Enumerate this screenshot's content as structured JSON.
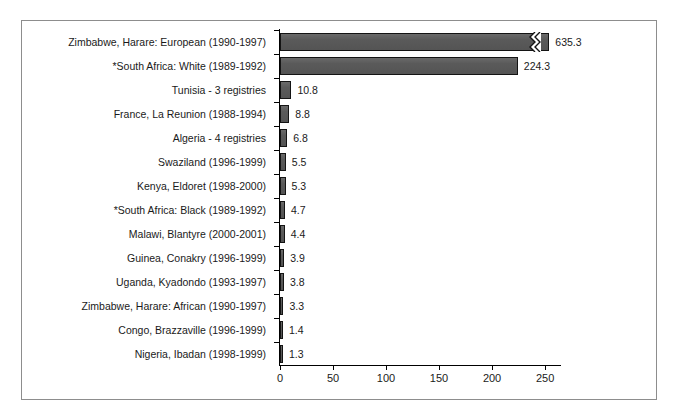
{
  "figure": {
    "background": "#ffffff",
    "border_color": "#8d8d8d",
    "bar_fill": "#5a5a5a",
    "bar_edge": "#141414",
    "text_color": "#1a1a1a"
  },
  "chart_data": {
    "type": "bar",
    "orientation": "horizontal",
    "title": "",
    "subtitle": "",
    "xlabel": "",
    "ylabel": "",
    "xlim": [
      0,
      265
    ],
    "xticks": [
      0,
      50,
      100,
      150,
      200,
      250
    ],
    "xtick_labels": [
      "0",
      "50",
      "100",
      "150",
      "200",
      "250"
    ],
    "grid": false,
    "legend": false,
    "axis_break": {
      "present": true,
      "series_index": 0,
      "note": "first bar truncated with zigzag break marker"
    },
    "categories": [
      "Zimbabwe, Harare: European (1990-1997)",
      "*South Africa: White (1989-1992)",
      "Tunisia - 3 registries",
      "France, La Reunion (1988-1994)",
      "Algeria - 4 registries",
      "Swaziland (1996-1999)",
      "Kenya, Eldoret (1998-2000)",
      "*South Africa: Black (1989-1992)",
      "Malawi, Blantyre (2000-2001)",
      "Guinea, Conakry (1996-1999)",
      "Uganda, Kyadondo (1993-1997)",
      "Zimbabwe, Harare: African (1990-1997)",
      "Congo, Brazzaville (1996-1999)",
      "Nigeria, Ibadan (1998-1999)"
    ],
    "values": [
      635.3,
      224.3,
      10.8,
      8.8,
      6.8,
      5.5,
      5.3,
      4.7,
      4.4,
      3.9,
      3.8,
      3.3,
      1.4,
      1.3
    ],
    "value_labels": [
      "635.3",
      "224.3",
      "10.8",
      "8.8",
      "6.8",
      "5.5",
      "5.3",
      "4.7",
      "4.4",
      "3.9",
      "3.8",
      "3.3",
      "1.4",
      "1.3"
    ],
    "drawn_lengths": [
      254,
      224.3,
      10.8,
      8.8,
      6.8,
      5.5,
      5.3,
      4.7,
      4.4,
      3.9,
      3.8,
      3.3,
      1.4,
      1.3
    ]
  }
}
